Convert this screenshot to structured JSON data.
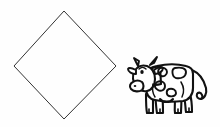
{
  "canvas": {
    "width": 220,
    "height": 127,
    "background_color": "#fefefe",
    "title": "Diamond and cow line drawing"
  },
  "palette": {
    "ink": "#222222",
    "cow_ink": "#111111",
    "paper": "#fefefe",
    "fill_white": "#ffffff"
  },
  "figures": [
    {
      "name": "diamond",
      "label": "Diamond (rotated square)",
      "stroke_color": "#333333",
      "stroke_width": 1,
      "fill": "none",
      "vertices": [
        {
          "x": 64,
          "y": 11
        },
        {
          "x": 116,
          "y": 66
        },
        {
          "x": 64,
          "y": 119
        },
        {
          "x": 14,
          "y": 66
        }
      ]
    },
    {
      "name": "cow",
      "label": "Cartoon spotted cow facing left",
      "stroke_color": "#111111",
      "stroke_width": 2,
      "bounding_box": {
        "x": 131,
        "y": 57,
        "width": 82,
        "height": 63
      },
      "parts": [
        "horns",
        "ears",
        "head",
        "eye",
        "muzzle",
        "nostril",
        "neck",
        "body",
        "back",
        "udder",
        "front-legs",
        "hind-legs",
        "hooves",
        "tail",
        "tail-tuft",
        "spots"
      ],
      "spot_count": 4
    }
  ],
  "paths": {
    "diamond": "M 64 11 L 116 66 L 64 119 L 14 66 Z",
    "cow_body": "M 149 74 C 149 69 154 66 161 66 C 170 65 180 65 187 66 C 190 66 192 68 192 71 L 192 88 C 192 95 189 99 184 100 C 176 101 166 101 158 100 C 151 99 147 95 147 88 Z",
    "cow_head": "M 136 70 C 134 73 134 78 136 82 C 138 86 142 89 146 89 C 150 89 153 86 154 82 C 155 77 154 72 151 69 C 147 66 139 66 136 70 Z",
    "cow_muzzle": "M 134 80 C 132 81 131 84 132 86 C 133 88 136 89 139 88 C 142 87 143 84 142 82 C 141 80 137 79 134 80 Z",
    "cow_horn_left": "M 136 68 L 133 60 L 137 62",
    "cow_horn_right": "M 151 67 L 156 58 L 155 63",
    "cow_ear_left": "M 136 69 L 129 67 L 134 72",
    "cow_ear_right": "M 153 69 L 161 65 L 157 72",
    "cow_neck": "M 150 72 C 155 70 160 69 165 69",
    "cow_tail": "M 191 70 C 197 72 202 78 204 86 C 205 92 203 97 199 98 C 196 99 194 97 195 94 C 196 92 199 92 200 94",
    "cow_leg_front_a": "M 152 98 L 150 114",
    "cow_leg_front_b": "M 159 99 L 160 114",
    "cow_leg_hind_a": "M 181 100 L 180 114",
    "cow_leg_hind_b": "M 188 99 L 191 113"
  },
  "annotations": {
    "figure_count": 2,
    "style": "black line art on white background",
    "visible_text": ""
  }
}
